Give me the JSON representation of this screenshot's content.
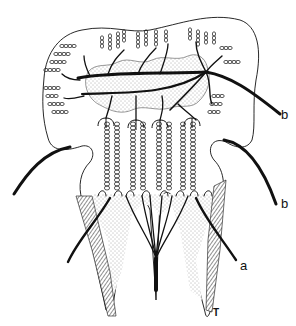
{
  "figure": {
    "type": "tooth innervation line drawing",
    "colors": {
      "ink": "#111111",
      "background": "#ffffff",
      "stipple": "#555555"
    },
    "labels": [
      {
        "id": "b-upper",
        "text": "b",
        "x": 281,
        "y": 108
      },
      {
        "id": "b-lower",
        "text": "b",
        "x": 281,
        "y": 197
      },
      {
        "id": "a",
        "text": "a",
        "x": 240,
        "y": 259
      },
      {
        "id": "T",
        "text": "T",
        "x": 213,
        "y": 308
      }
    ]
  }
}
